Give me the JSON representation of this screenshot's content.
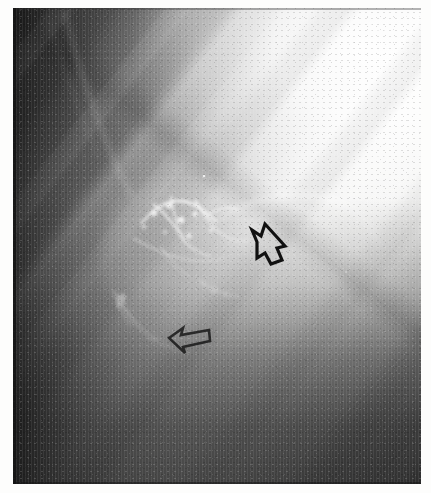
{
  "image": {
    "modality": "angiogram",
    "description": "Grayscale subtraction angiogram / radiograph of a vascular malformation",
    "orientation": "lateral-oblique",
    "tone": {
      "background_dark": "#3a3a3a",
      "background_mid": "#8f8f8f",
      "background_bright": "#f4f4f3",
      "highlight_white": "#ffffff",
      "annotation_black": "#111111",
      "paper_white": "#fdfdfc"
    },
    "plate": {
      "left": 13,
      "top": 8,
      "width": 408,
      "height": 476
    }
  },
  "annotations": {
    "count": 2,
    "style": "hand-drawn open outline arrow",
    "color": "#111111",
    "items": [
      {
        "name": "upper-arrow",
        "label": "open arrow (upper)",
        "points_toward": "down-left",
        "x": 246,
        "y": 224,
        "width": 36,
        "height": 48,
        "contrast": "high"
      },
      {
        "name": "lower-arrow",
        "label": "open arrow (lower)",
        "points_toward": "left",
        "x": 167,
        "y": 320,
        "width": 42,
        "height": 30,
        "contrast": "faint"
      }
    ]
  },
  "features": {
    "nidus": {
      "label": "dense tangle of bright vessels (nidus)",
      "center_x": 175,
      "center_y": 232
    },
    "draining_vein": {
      "label": "curved bright draining vessel looping right",
      "center_x": 310,
      "center_y": 250
    },
    "inferior_vessel": {
      "label": "bright curved vessel inferolateral",
      "center_x": 125,
      "center_y": 305
    },
    "diagonal_bands": {
      "label": "diagonal collimation / bone density bands",
      "angle_deg": 128
    }
  }
}
